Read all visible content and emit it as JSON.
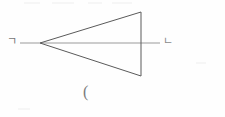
{
  "figure": {
    "background_color": "#fefefe",
    "stroke_color": "#5a5a5a",
    "axis_color": "#9a9a9a",
    "canvas": {
      "width": 225,
      "height": 117
    },
    "labels": {
      "left_vertex": "ㄱ",
      "right_vertex": "ㄴ",
      "bottom_caption": "("
    },
    "shapes": {
      "triangle": {
        "name": "triangle",
        "points": "40,43 141,12 141,76",
        "apex": {
          "x": 40,
          "y": 43
        },
        "top_right": {
          "x": 141,
          "y": 12
        },
        "bottom_right": {
          "x": 141,
          "y": 76
        },
        "fill": "none",
        "stroke_width": 1
      },
      "axis_line": {
        "name": "horizontal-axis-line",
        "x1": 20,
        "y1": 43,
        "x2": 160,
        "y2": 43,
        "stroke_width": 1
      }
    }
  }
}
